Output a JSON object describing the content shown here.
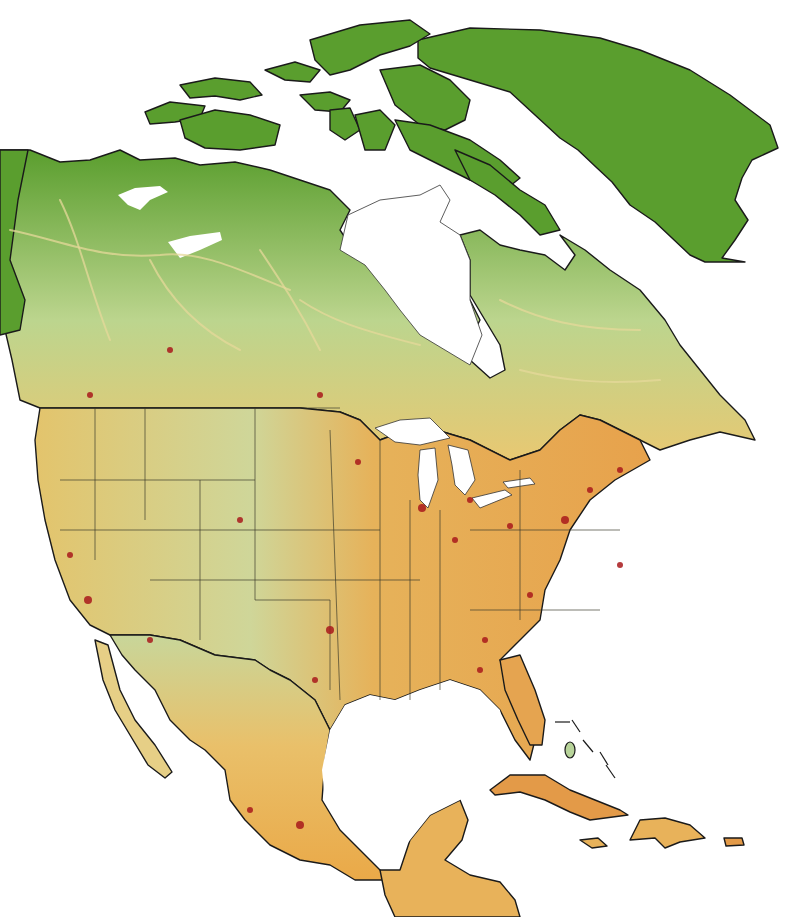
{
  "map": {
    "subject": "North America",
    "colors": {
      "water": "#ffffff",
      "wild_green": "#5a9e2e",
      "light_green": "#b8d49a",
      "yellow": "#efd27a",
      "orange": "#e8a94a",
      "red_dense": "#a8191b",
      "coastline": "#1a1a1a",
      "roads_remote": "#e6d89a"
    },
    "regions": [
      {
        "name": "greenland",
        "fill": "#5a9e2e"
      },
      {
        "name": "canadian-arctic-archipelago",
        "fill": "#5a9e2e"
      },
      {
        "name": "canada-north",
        "fill": "#5a9e2e"
      },
      {
        "name": "canada-south-band",
        "fill": "#c7d88a"
      },
      {
        "name": "united-states",
        "fill": "#e9c468"
      },
      {
        "name": "mexico",
        "fill": "#eab356"
      },
      {
        "name": "central-america",
        "fill": "#e8b25a"
      },
      {
        "name": "cuba",
        "fill": "#e59a4a"
      },
      {
        "name": "hispaniola",
        "fill": "#e8b25a"
      },
      {
        "name": "jamaica",
        "fill": "#e8b25a"
      },
      {
        "name": "puerto-rico",
        "fill": "#e59a4a"
      }
    ],
    "lakes": [
      "hudson-bay",
      "great-lakes",
      "great-bear-lake",
      "great-slave-lake",
      "gulf-of-mexico"
    ]
  }
}
